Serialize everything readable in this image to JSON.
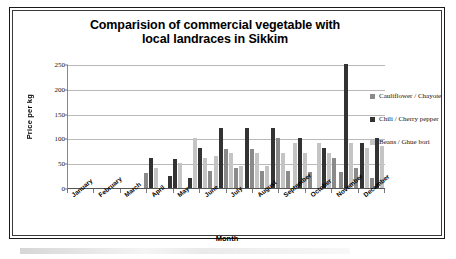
{
  "chart_data": {
    "type": "bar",
    "title": "Comparision of commercial vegetable with local landraces in Sikkim",
    "title_line1": "Comparision of commercial vegetable with",
    "title_line2": "local landraces in Sikkim",
    "xlabel": "Month",
    "ylabel": "Price per kg",
    "ylim": [
      0,
      250
    ],
    "yticks": [
      0,
      50,
      100,
      150,
      200,
      250
    ],
    "grid": true,
    "legend_position": "right",
    "categories": [
      "January",
      "February",
      "March",
      "April",
      "May",
      "June",
      "July",
      "August",
      "September",
      "October",
      "November",
      "December"
    ],
    "series": [
      {
        "name": "Cauliflower / Chayote",
        "color": "#8a8a8a",
        "values": [
          0,
          0,
          0,
          30,
          0,
          0,
          0,
          0,
          0,
          0,
          0,
          0
        ]
      },
      {
        "name": "Chili / Cherry pepper",
        "color": "#333333",
        "values": [
          0,
          0,
          0,
          60,
          58,
          80,
          120,
          120,
          120,
          100,
          80,
          250
        ]
      },
      {
        "name": "Beans / Ghue bori",
        "color": "#c4c4c4",
        "values": [
          0,
          0,
          0,
          40,
          50,
          100,
          70,
          70,
          70,
          90,
          70,
          90
        ]
      }
    ],
    "groups": [
      {
        "month": "January",
        "bars": []
      },
      {
        "month": "February",
        "bars": []
      },
      {
        "month": "March",
        "bars": []
      },
      {
        "month": "April",
        "bars": [
          {
            "series": "Cauliflower / Chayote",
            "value": 30
          },
          {
            "series": "Chili / Cherry pepper",
            "value": 60
          },
          {
            "series": "Beans / Ghue bori",
            "value": 40
          }
        ]
      },
      {
        "month": "May",
        "bars": [
          {
            "series": "Chili / Cherry pepper",
            "value": 25
          },
          {
            "series": "Chili / Cherry pepper",
            "value": 58
          },
          {
            "series": "Beans / Ghue bori",
            "value": 50
          }
        ]
      },
      {
        "month": "June",
        "bars": [
          {
            "series": "Chili / Cherry pepper",
            "value": 20
          },
          {
            "series": "Beans / Ghue bori",
            "value": 100
          },
          {
            "series": "Chili / Cherry pepper",
            "value": 80
          },
          {
            "series": "Beans / Ghue bori",
            "value": 60
          },
          {
            "series": "Cauliflower / Chayote",
            "value": 35
          }
        ]
      },
      {
        "month": "July",
        "bars": [
          {
            "series": "Beans / Ghue bori",
            "value": 65
          },
          {
            "series": "Chili / Cherry pepper",
            "value": 120
          },
          {
            "series": "Cauliflower / Chayote",
            "value": 78
          },
          {
            "series": "Beans / Ghue bori",
            "value": 70
          },
          {
            "series": "Cauliflower / Chayote",
            "value": 40
          }
        ]
      },
      {
        "month": "August",
        "bars": [
          {
            "series": "Beans / Ghue bori",
            "value": 45
          },
          {
            "series": "Chili / Cherry pepper",
            "value": 120
          },
          {
            "series": "Cauliflower / Chayote",
            "value": 78
          },
          {
            "series": "Beans / Ghue bori",
            "value": 70
          },
          {
            "series": "Cauliflower / Chayote",
            "value": 35
          }
        ]
      },
      {
        "month": "September",
        "bars": [
          {
            "series": "Beans / Ghue bori",
            "value": 45
          },
          {
            "series": "Chili / Cherry pepper",
            "value": 120
          },
          {
            "series": "Cauliflower / Chayote",
            "value": 100
          },
          {
            "series": "Beans / Ghue bori",
            "value": 70
          },
          {
            "series": "Cauliflower / Chayote",
            "value": 35
          }
        ]
      },
      {
        "month": "October",
        "bars": [
          {
            "series": "Beans / Ghue bori",
            "value": 90
          },
          {
            "series": "Chili / Cherry pepper",
            "value": 100
          },
          {
            "series": "Beans / Ghue bori",
            "value": 70
          },
          {
            "series": "Cauliflower / Chayote",
            "value": 32
          }
        ]
      },
      {
        "month": "November",
        "bars": [
          {
            "series": "Beans / Ghue bori",
            "value": 90
          },
          {
            "series": "Chili / Cherry pepper",
            "value": 80
          },
          {
            "series": "Beans / Ghue bori",
            "value": 70
          },
          {
            "series": "Cauliflower / Chayote",
            "value": 60
          }
        ]
      },
      {
        "month": "December",
        "bars": [
          {
            "series": "Cauliflower / Chayote",
            "value": 32
          },
          {
            "series": "Chili / Cherry pepper",
            "value": 250
          },
          {
            "series": "Beans / Ghue bori",
            "value": 90
          },
          {
            "series": "Cauliflower / Chayote",
            "value": 40
          },
          {
            "series": "Chili / Cherry pepper",
            "value": 90
          },
          {
            "series": "Beans / Ghue bori",
            "value": 80
          },
          {
            "series": "Cauliflower / Chayote",
            "value": 20
          },
          {
            "series": "Chili / Cherry pepper",
            "value": 100
          },
          {
            "series": "Beans / Ghue bori",
            "value": 85
          }
        ]
      }
    ]
  },
  "legend": {
    "items": [
      {
        "label": "Cauliflower / Chayote",
        "color": "#8a8a8a"
      },
      {
        "label": "Chili / Cherry pepper",
        "color": "#333333"
      },
      {
        "label": "Beans / Ghue bori",
        "color": "#c4c4c4"
      }
    ]
  }
}
